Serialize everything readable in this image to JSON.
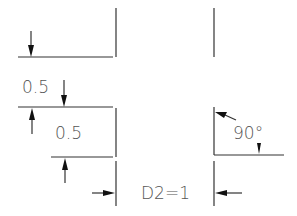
{
  "diagram": {
    "type": "cad-dimension-illustration",
    "labels": {
      "dim_upper": "0.5",
      "dim_lower": "0.5",
      "angle": "90°",
      "width": "D2=1"
    },
    "colors": {
      "line": "#333333",
      "arrow": "#111111",
      "text": "#555555",
      "background": "#ffffff"
    }
  }
}
